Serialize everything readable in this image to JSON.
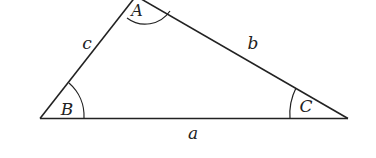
{
  "diagram": {
    "type": "triangle",
    "stroke_color": "#222222",
    "background": "#ffffff",
    "vertices": [
      {
        "name": "A",
        "label": "A"
      },
      {
        "name": "B",
        "label": "B"
      },
      {
        "name": "C",
        "label": "C"
      }
    ],
    "sides": [
      {
        "name": "a",
        "label": "a",
        "between": "B-C"
      },
      {
        "name": "b",
        "label": "b",
        "between": "A-C"
      },
      {
        "name": "c",
        "label": "c",
        "between": "A-B"
      }
    ]
  }
}
